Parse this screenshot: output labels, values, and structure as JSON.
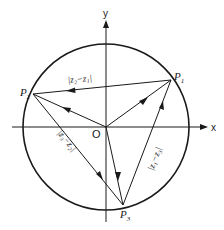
{
  "diagram": {
    "axes": {
      "x_label": "x",
      "y_label": "y",
      "origin_label": "O"
    },
    "points": {
      "p1": {
        "label": "P",
        "sub": "1"
      },
      "p2": {
        "label": "P",
        "sub": "2"
      },
      "p3": {
        "label": "P",
        "sub": "3"
      }
    },
    "edges": {
      "p1_p2": {
        "label": "|z₂−z₁|"
      },
      "p2_p3": {
        "label": "|z₃−z₂|"
      },
      "p3_p1": {
        "label": "|z₁−z₃|"
      }
    },
    "colors": {
      "stroke": "#1a1a1a",
      "background": "#ffffff"
    }
  }
}
